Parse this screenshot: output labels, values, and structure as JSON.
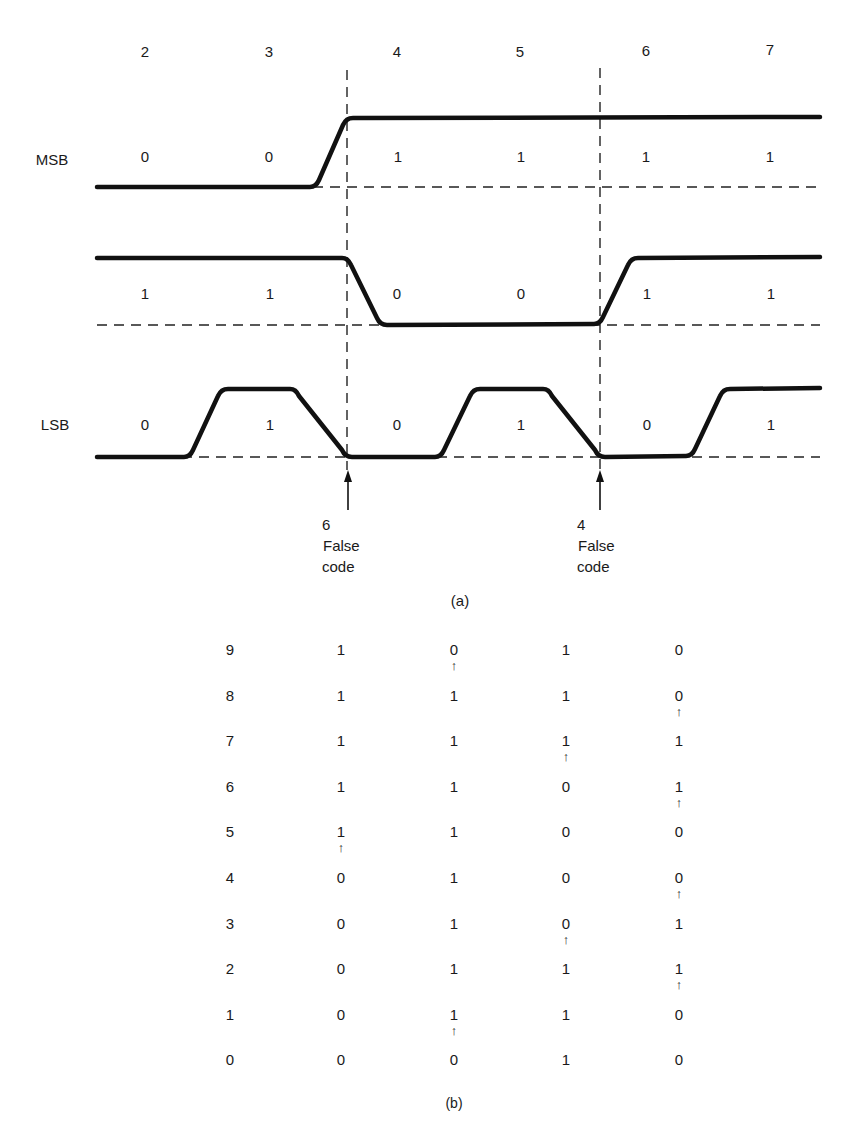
{
  "figure_a": {
    "caption": "(a)",
    "column_codes": [
      "2",
      "3",
      "4",
      "5",
      "6",
      "7"
    ],
    "row_labels": {
      "msb": "MSB",
      "mid": "",
      "lsb": "LSB"
    },
    "bits": {
      "msb": [
        "0",
        "0",
        "1",
        "1",
        "1",
        "1"
      ],
      "mid": [
        "1",
        "1",
        "0",
        "0",
        "1",
        "1"
      ],
      "lsb": [
        "0",
        "1",
        "0",
        "1",
        "0",
        "1"
      ]
    },
    "false_code_markers": [
      {
        "code": "6",
        "line1": "False",
        "line2": "code"
      },
      {
        "code": "4",
        "line1": "False",
        "line2": "code"
      }
    ]
  },
  "figure_b": {
    "caption": "(b)",
    "rows": [
      {
        "code": "9",
        "values": [
          "1",
          "0",
          "1",
          "0"
        ],
        "arrow_below": [
          false,
          true,
          false,
          false
        ]
      },
      {
        "code": "8",
        "values": [
          "1",
          "1",
          "1",
          "0"
        ],
        "arrow_below": [
          false,
          false,
          false,
          true
        ]
      },
      {
        "code": "7",
        "values": [
          "1",
          "1",
          "1",
          "1"
        ],
        "arrow_below": [
          false,
          false,
          true,
          false
        ]
      },
      {
        "code": "6",
        "values": [
          "1",
          "1",
          "0",
          "1"
        ],
        "arrow_below": [
          false,
          false,
          false,
          true
        ]
      },
      {
        "code": "5",
        "values": [
          "1",
          "1",
          "0",
          "0"
        ],
        "arrow_below": [
          true,
          false,
          false,
          false
        ]
      },
      {
        "code": "4",
        "values": [
          "0",
          "1",
          "0",
          "0"
        ],
        "arrow_below": [
          false,
          false,
          false,
          true
        ]
      },
      {
        "code": "3",
        "values": [
          "0",
          "1",
          "0",
          "1"
        ],
        "arrow_below": [
          false,
          false,
          true,
          false
        ]
      },
      {
        "code": "2",
        "values": [
          "0",
          "1",
          "1",
          "1"
        ],
        "arrow_below": [
          false,
          false,
          false,
          true
        ]
      },
      {
        "code": "1",
        "values": [
          "0",
          "1",
          "1",
          "0"
        ],
        "arrow_below": [
          false,
          true,
          false,
          false
        ]
      },
      {
        "code": "0",
        "values": [
          "0",
          "0",
          "1",
          "0"
        ],
        "arrow_below": [
          false,
          false,
          false,
          false
        ]
      }
    ],
    "arrow_glyph": "↑"
  }
}
